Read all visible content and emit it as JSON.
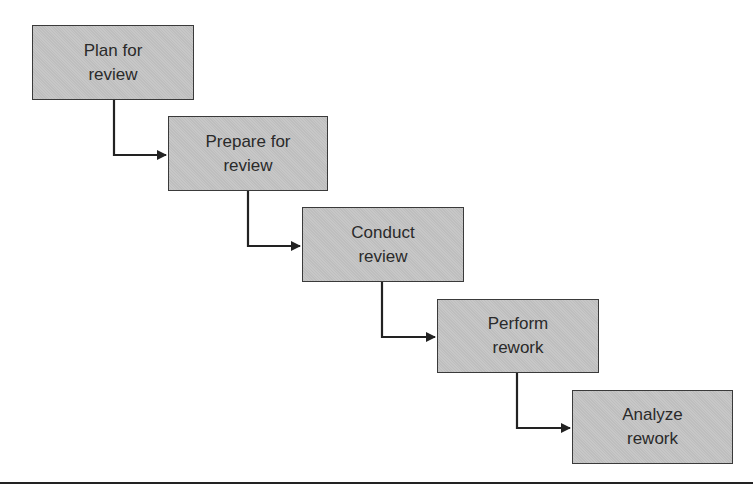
{
  "diagram": {
    "type": "staircase-process-flow",
    "steps": [
      {
        "label": "Plan for\nreview"
      },
      {
        "label": "Prepare for\nreview"
      },
      {
        "label": "Conduct\nreview"
      },
      {
        "label": "Perform\nrework"
      },
      {
        "label": "Analyze\nrework"
      }
    ],
    "colors": {
      "box_fill": "#c4c4c4",
      "box_border": "#3a3a3a",
      "arrow": "#222222",
      "text": "#2a2a2a"
    }
  }
}
